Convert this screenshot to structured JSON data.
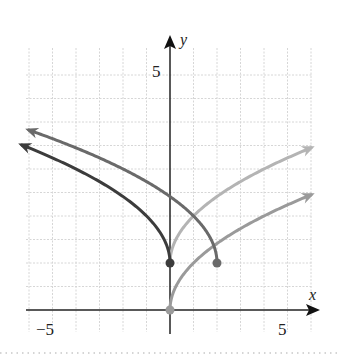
{
  "chart_data": {
    "type": "line",
    "title": "",
    "xlabel": "x",
    "ylabel": "y",
    "x_tick_labels": [
      {
        "value": -5,
        "label": "−5"
      },
      {
        "value": 5,
        "label": "5"
      }
    ],
    "y_tick_labels": [
      {
        "value": 5,
        "label": "5"
      }
    ],
    "xlim": [
      -6.3,
      6.2
    ],
    "ylim": [
      -0.5,
      5.8
    ],
    "grid": true,
    "grid_x_step": 1,
    "grid_y_step": 0.5,
    "legend": null,
    "series": [
      {
        "name": "y = sqrt(x)",
        "formula": "sqrt(x)",
        "domain": [
          0,
          6.0
        ],
        "start_point": [
          0,
          0
        ],
        "start_dot": true,
        "arrow_end": true,
        "color": "#9a9a9a",
        "points": [
          [
            0,
            0
          ],
          [
            1,
            1
          ],
          [
            2,
            1.41
          ],
          [
            3,
            1.73
          ],
          [
            4,
            2
          ],
          [
            5,
            2.24
          ],
          [
            6,
            2.45
          ]
        ]
      },
      {
        "name": "y = sqrt(x) + 1",
        "formula": "sqrt(x)+1",
        "domain": [
          0,
          6.0
        ],
        "start_point": [
          0,
          1
        ],
        "start_dot": false,
        "arrow_end": true,
        "color": "#b4b4b4",
        "points": [
          [
            0,
            1
          ],
          [
            1,
            2
          ],
          [
            2,
            2.41
          ],
          [
            3,
            2.73
          ],
          [
            4,
            3
          ],
          [
            5,
            3.24
          ],
          [
            6,
            3.45
          ]
        ]
      },
      {
        "name": "y = sqrt(-x) + 1",
        "formula": "sqrt(-x)+1",
        "domain": [
          -6.3,
          0
        ],
        "start_point": [
          0,
          1
        ],
        "start_dot": true,
        "arrow_end": true,
        "color": "#3c3c3c",
        "points": [
          [
            0,
            1
          ],
          [
            -1,
            2
          ],
          [
            -2,
            2.41
          ],
          [
            -3,
            2.73
          ],
          [
            -4,
            3
          ],
          [
            -5,
            3.24
          ],
          [
            -6,
            3.45
          ]
        ]
      },
      {
        "name": "y = sqrt(2 - x) + 1",
        "formula": "sqrt(2-x)+1",
        "domain": [
          -6.0,
          2
        ],
        "start_point": [
          2,
          1
        ],
        "start_dot": true,
        "arrow_end": true,
        "color": "#6a6a6a",
        "points": [
          [
            2,
            1
          ],
          [
            1,
            2
          ],
          [
            0,
            2.41
          ],
          [
            -1,
            2.73
          ],
          [
            -2,
            3
          ],
          [
            -4,
            3.45
          ],
          [
            -6,
            3.83
          ]
        ]
      }
    ]
  }
}
